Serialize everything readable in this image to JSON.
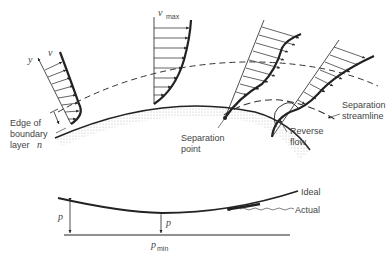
{
  "diagram": {
    "upper_panel": {
      "symbols": {
        "y_axis": "y",
        "velocity": "v",
        "max_velocity": "v",
        "max_velocity_sub": "max",
        "normal": "n"
      },
      "labels": {
        "edge_of_boundary_layer_1": "Edge of",
        "edge_of_boundary_layer_2": "boundary",
        "edge_of_boundary_layer_3": "layer",
        "separation_point_1": "Separation",
        "separation_point_2": "point",
        "reverse_flow_1": "Reverse",
        "reverse_flow_2": "flow",
        "separation_streamline_1": "Separation",
        "separation_streamline_2": "streamline"
      },
      "profiles": [
        "accelerating profile",
        "max velocity profile",
        "profile near separation",
        "profile with reverse flow"
      ]
    },
    "lower_panel": {
      "symbols": {
        "pressure_left": "p",
        "pressure_mid": "p",
        "p_min": "p",
        "p_min_sub": "min"
      },
      "labels": {
        "ideal": "Ideal",
        "actual": "Actual"
      }
    },
    "colors": {
      "ink": "#222222",
      "text": "#444444",
      "shading": "#d8d8d8"
    }
  }
}
